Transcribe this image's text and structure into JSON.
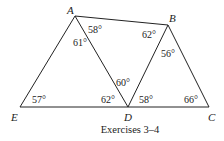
{
  "diagram": {
    "caption": "Exercises 3–4",
    "vertices": [
      {
        "id": "A",
        "label": "A",
        "x": 75,
        "y": 16,
        "lx": 67,
        "ly": 14
      },
      {
        "id": "B",
        "label": "B",
        "x": 168,
        "y": 25,
        "lx": 169,
        "ly": 22
      },
      {
        "id": "C",
        "label": "C",
        "x": 209,
        "y": 107,
        "lx": 209,
        "ly": 121
      },
      {
        "id": "D",
        "label": "D",
        "x": 128,
        "y": 107,
        "lx": 124,
        "ly": 121
      },
      {
        "id": "E",
        "label": "E",
        "x": 20,
        "y": 107,
        "lx": 11,
        "ly": 121
      }
    ],
    "segments": [
      [
        "A",
        "B"
      ],
      [
        "A",
        "E"
      ],
      [
        "A",
        "D"
      ],
      [
        "B",
        "D"
      ],
      [
        "B",
        "C"
      ],
      [
        "E",
        "C"
      ]
    ],
    "angles": [
      {
        "vertex": "A",
        "label": "61°",
        "x": 73,
        "y": 46
      },
      {
        "vertex": "A",
        "label": "58°",
        "x": 88,
        "y": 33
      },
      {
        "vertex": "B",
        "label": "62°",
        "x": 142,
        "y": 38
      },
      {
        "vertex": "B",
        "label": "56°",
        "x": 162,
        "y": 57
      },
      {
        "vertex": "D",
        "label": "60°",
        "x": 117,
        "y": 86
      },
      {
        "vertex": "D",
        "label": "62°",
        "x": 101,
        "y": 103
      },
      {
        "vertex": "D",
        "label": "58°",
        "x": 139,
        "y": 103
      },
      {
        "vertex": "E",
        "label": "57°",
        "x": 32,
        "y": 103
      },
      {
        "vertex": "C",
        "label": "66°",
        "x": 184,
        "y": 103
      }
    ],
    "stroke_color": "#222222"
  }
}
